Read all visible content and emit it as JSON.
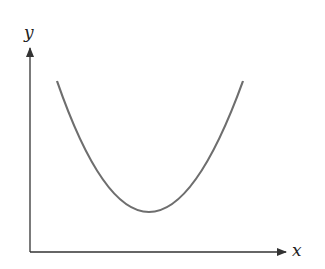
{
  "diagram": {
    "type": "parabola-sketch",
    "x_axis_label": "x",
    "y_axis_label": "y",
    "curve": {
      "shape": "upward parabola",
      "vertex": [
        148,
        212
      ],
      "left_end": [
        57,
        81
      ],
      "right_end": [
        243,
        81
      ],
      "color": "#6e6e6e"
    },
    "axis_color": "#333333"
  }
}
